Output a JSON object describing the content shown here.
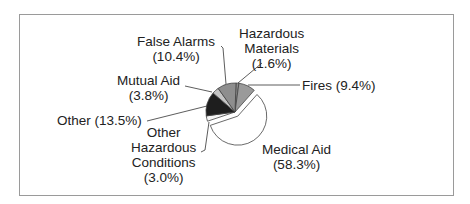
{
  "chart_data": {
    "type": "pie",
    "title": "",
    "exploded": [
      "Medical Aid"
    ],
    "slices": [
      {
        "label": "Hazardous Materials",
        "value": 1.6,
        "display": "(1.6%)",
        "color": "#8c8c8c"
      },
      {
        "label": "Fires",
        "value": 9.4,
        "display": "(9.4%)",
        "color": "#9a9a9a"
      },
      {
        "label": "Medical Aid",
        "value": 58.3,
        "display": "(58.3%)",
        "color": "#ffffff"
      },
      {
        "label": "Other Hazardous Conditions",
        "value": 3.0,
        "display": "(3.0%)",
        "color": "#f4f4f4"
      },
      {
        "label": "Other",
        "value": 13.5,
        "display": "(13.5%)",
        "color": "#1e1e1e"
      },
      {
        "label": "Mutual Aid",
        "value": 3.8,
        "display": "(3.8%)",
        "color": "#c4c4c4"
      },
      {
        "label": "False Alarms",
        "value": 10.4,
        "display": "(10.4%)",
        "color": "#8e8e8e"
      }
    ]
  },
  "labels": {
    "false_alarms": {
      "line1": "False Alarms",
      "line2": "(10.4%)"
    },
    "hazardous_materials": {
      "line1": "Hazardous",
      "line2": "Materials",
      "line3": "(1.6%)"
    },
    "fires": {
      "line1": "Fires (9.4%)"
    },
    "mutual_aid": {
      "line1": "Mutual Aid",
      "line2": "(3.8%)"
    },
    "other": {
      "line1": "Other (13.5%)"
    },
    "other_hazardous": {
      "line1": "Other",
      "line2": "Hazardous",
      "line3": "Conditions",
      "line4": "(3.0%)"
    },
    "medical_aid": {
      "line1": "Medical Aid",
      "line2": "(58.3%)"
    }
  }
}
